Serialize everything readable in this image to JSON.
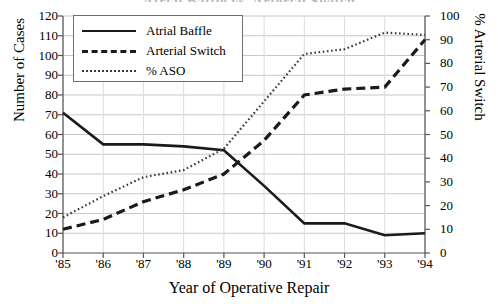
{
  "chart_data": {
    "type": "line",
    "title": "Atrial Baffle vs. Arterial Switch",
    "xlabel": "Year of Operative Repair",
    "ylabel": "Number of Cases",
    "ylabel_right": "% Arterial Switch",
    "categories": [
      "'85",
      "'86",
      "'87",
      "'88",
      "'89",
      "'90",
      "'91",
      "'92",
      "'93",
      "'94"
    ],
    "ylim": [
      0,
      120
    ],
    "yticks": [
      0,
      10,
      20,
      30,
      40,
      50,
      60,
      70,
      80,
      90,
      100,
      110,
      120
    ],
    "ylim_right": [
      0,
      100
    ],
    "yticks_right": [
      0,
      10,
      20,
      30,
      40,
      50,
      60,
      70,
      80,
      90,
      100
    ],
    "grid": true,
    "legend_position": "upper-left",
    "series": [
      {
        "name": "Atrial Baffle",
        "style": "solid",
        "axis": "left",
        "color": "#1a1a1a",
        "values": [
          71,
          55,
          55,
          54,
          52,
          34,
          15,
          15,
          9,
          10
        ]
      },
      {
        "name": "Arterial Switch",
        "style": "dashed",
        "axis": "left",
        "color": "#1a1a1a",
        "values": [
          12,
          17,
          26,
          32,
          40,
          57,
          80,
          83,
          84,
          108
        ]
      },
      {
        "name": "% ASO",
        "style": "dotted",
        "axis": "right",
        "color": "#3a3a3a",
        "values": [
          15,
          24,
          32,
          35,
          44,
          64,
          84,
          86,
          93,
          92
        ]
      }
    ]
  },
  "legend": {
    "items": [
      {
        "label": "Atrial Baffle",
        "style": "solid"
      },
      {
        "label": "Arterial Switch",
        "style": "dashed"
      },
      {
        "label": "% ASO",
        "style": "dotted"
      }
    ]
  }
}
